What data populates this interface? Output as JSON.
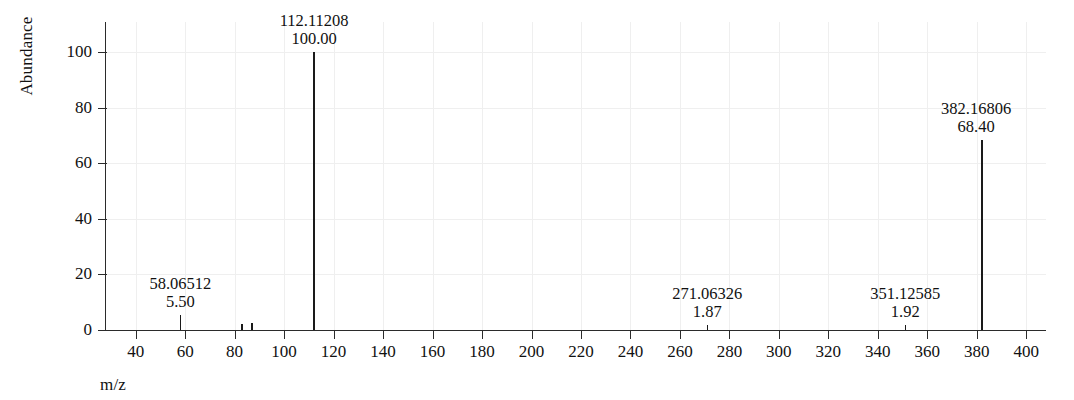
{
  "chart_data": {
    "type": "bar",
    "subtype": "mass-spectrum-stick",
    "title": "",
    "xlabel": "m/z",
    "ylabel": "Abundance",
    "xlim": [
      28,
      408
    ],
    "ylim": [
      0,
      110
    ],
    "grid": "faint light-gray at all ticks",
    "legend": "none",
    "line_color": "#1a1a1a",
    "background": "#ffffff",
    "xticks": [
      40,
      60,
      80,
      100,
      120,
      140,
      160,
      180,
      200,
      220,
      240,
      260,
      280,
      300,
      320,
      340,
      360,
      380,
      400
    ],
    "yticks": [
      0,
      20,
      40,
      60,
      80,
      100
    ],
    "peaks": [
      {
        "mz": 58.06512,
        "abundance": 5.5,
        "mz_text": "58.06512",
        "ab_text": "5.50",
        "labeled": true,
        "label_dx": 0
      },
      {
        "mz": 83.0,
        "abundance": 2.0,
        "mz_text": "",
        "ab_text": "",
        "labeled": false,
        "label_dx": 0
      },
      {
        "mz": 87.0,
        "abundance": 2.6,
        "mz_text": "",
        "ab_text": "",
        "labeled": false,
        "label_dx": 0
      },
      {
        "mz": 112.11208,
        "abundance": 100.0,
        "mz_text": "112.11208",
        "ab_text": "100.00",
        "labeled": true,
        "label_dx": 0
      },
      {
        "mz": 271.06326,
        "abundance": 1.87,
        "mz_text": "271.06326",
        "ab_text": "1.87",
        "labeled": true,
        "label_dx": 0
      },
      {
        "mz": 351.12585,
        "abundance": 1.92,
        "mz_text": "351.12585",
        "ab_text": "1.92",
        "labeled": true,
        "label_dx": 0
      },
      {
        "mz": 382.16806,
        "abundance": 68.4,
        "mz_text": "382.16806",
        "ab_text": "68.40",
        "labeled": true,
        "label_dx": -6
      }
    ]
  },
  "axes": {
    "y_title": "Abundance",
    "x_title": "m/z",
    "y_tick_labels": [
      "0",
      "20",
      "40",
      "60",
      "80",
      "100"
    ],
    "x_tick_labels": [
      "40",
      "60",
      "80",
      "100",
      "120",
      "140",
      "160",
      "180",
      "200",
      "220",
      "240",
      "260",
      "280",
      "300",
      "320",
      "340",
      "360",
      "380",
      "400"
    ]
  }
}
